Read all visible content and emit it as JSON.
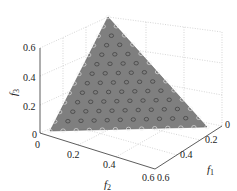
{
  "chart_data": {
    "type": "scatter3d",
    "title": "",
    "xlabel": "f1",
    "ylabel": "f2",
    "zlabel": "f3",
    "axes": {
      "f1": {
        "ticks": [
          "0",
          "0.2",
          "0.4",
          "0.6"
        ],
        "range": [
          0,
          0.6
        ]
      },
      "f2": {
        "ticks": [
          "0",
          "0.2",
          "0.4",
          "0.6"
        ],
        "range": [
          0,
          0.6
        ]
      },
      "f3": {
        "ticks": [
          "0",
          "0.2",
          "0.4",
          "0.6"
        ],
        "range": [
          0,
          0.6
        ]
      }
    },
    "surface": {
      "description": "triangular plane f1+f2+f3=0.5",
      "vertices": [
        [
          0.5,
          0,
          0
        ],
        [
          0,
          0.5,
          0
        ],
        [
          0,
          0,
          0.5
        ]
      ],
      "color": "#808080"
    },
    "points": {
      "marker": "circle",
      "description": "uniformly distributed points on plane f1+f2+f3=0.5",
      "count": 91
    },
    "grid": true,
    "box": true
  },
  "labels": {
    "f1": "f",
    "f1_sub": "1",
    "f2": "f",
    "f2_sub": "2",
    "f3": "f",
    "f3_sub": "3",
    "z_ticks": [
      "0",
      "0.2",
      "0.4",
      "0.6"
    ],
    "f2_ticks": [
      "0",
      "0.2",
      "0.4",
      "0.6"
    ],
    "f1_ticks": [
      "0",
      "0.2",
      "0.4",
      "0.6"
    ]
  }
}
